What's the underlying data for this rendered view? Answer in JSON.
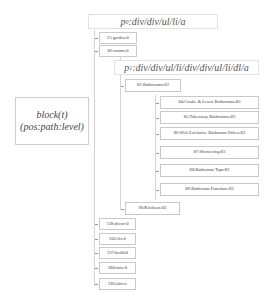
{
  "paths": {
    "p0": {
      "symbol": "p",
      "sub": "0",
      "text": ":div/div/ul/li/a"
    },
    "p1": {
      "symbol": "p",
      "sub": "1",
      "text": ":div/div/ul/li/div/div/ul/li/dl/a"
    }
  },
  "legend": {
    "line1": "block(t)",
    "line2": "(pos:path:level)"
  },
  "root_nodes": [
    {
      "label": "25 garden:0"
    },
    {
      "label": "82:rooms:0"
    },
    {
      "label": "138:décor:0"
    },
    {
      "label": "202:fix:0"
    },
    {
      "label": "237:build:0"
    },
    {
      "label": "280:mix:0"
    },
    {
      "label": "283:offers"
    }
  ],
  "level1_nodes": [
    {
      "label": "83:Bathrooms:82"
    },
    {
      "label": "90:Kitchens:82"
    }
  ],
  "level2_nodes": [
    {
      "label": "84:Cooke & Lewis Bathrooms:83"
    },
    {
      "label": "85:Takeaway Bathrooms:83"
    },
    {
      "label": "86:Web Exclusive Bathroom Offers:83"
    },
    {
      "label": "87:Showering:83"
    },
    {
      "label": "88:Bathroom Taps:83"
    },
    {
      "label": "89:Bathroom Furniture:83"
    }
  ]
}
